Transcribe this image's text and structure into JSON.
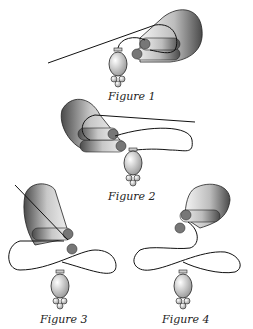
{
  "figures": [
    {
      "id": "fig1",
      "caption": "Figure 1"
    },
    {
      "id": "fig2",
      "caption": "Figure 2"
    },
    {
      "id": "fig3",
      "caption": "Figure 3"
    },
    {
      "id": "fig4",
      "caption": "Figure 4"
    }
  ],
  "colors": {
    "line": "#111111",
    "shadeDark": "#555555",
    "shadeLight": "#f2f2f2",
    "fingertip": "#777777"
  }
}
